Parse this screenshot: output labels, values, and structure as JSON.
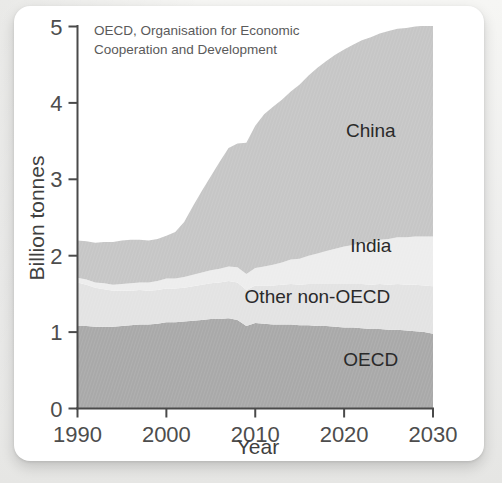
{
  "figure": {
    "note_line1": "OECD,  Organisation for Economic",
    "note_line2": "Cooperation and Development"
  },
  "chart_data": {
    "type": "area",
    "stacked": true,
    "title": "",
    "subtitle": "",
    "note": "OECD,  Organisation for Economic Cooperation and Development",
    "xlabel": "Year",
    "ylabel": "Billion tonnes",
    "xlim": [
      1990,
      2030
    ],
    "ylim": [
      0,
      5
    ],
    "xticks": [
      1990,
      2000,
      2010,
      2020,
      2030
    ],
    "xticklabels": [
      "1990",
      "2000",
      "2010",
      "2020",
      "2030"
    ],
    "yticks": [
      0,
      1,
      2,
      3,
      4,
      5
    ],
    "yticklabels": [
      "0",
      "1",
      "2",
      "3",
      "4",
      "5"
    ],
    "grid": false,
    "legend_position": "inline-annotations",
    "x": [
      1990,
      1991,
      1992,
      1993,
      1994,
      1995,
      1996,
      1997,
      1998,
      1999,
      2000,
      2001,
      2002,
      2003,
      2004,
      2005,
      2006,
      2007,
      2008,
      2009,
      2010,
      2011,
      2012,
      2013,
      2014,
      2015,
      2016,
      2017,
      2018,
      2019,
      2020,
      2021,
      2022,
      2023,
      2024,
      2025,
      2026,
      2027,
      2028,
      2029,
      2030
    ],
    "series": [
      {
        "name": "OECD",
        "color": "#a9a9a9",
        "values": [
          1.08,
          1.08,
          1.07,
          1.07,
          1.07,
          1.08,
          1.09,
          1.1,
          1.1,
          1.11,
          1.13,
          1.13,
          1.14,
          1.15,
          1.16,
          1.17,
          1.17,
          1.18,
          1.16,
          1.08,
          1.12,
          1.11,
          1.1,
          1.1,
          1.1,
          1.09,
          1.09,
          1.08,
          1.08,
          1.07,
          1.06,
          1.06,
          1.05,
          1.04,
          1.04,
          1.03,
          1.03,
          1.02,
          1.01,
          1.0,
          0.98
        ]
      },
      {
        "name": "Other non-OECD",
        "color": "#e3e3e3",
        "values": [
          0.57,
          0.54,
          0.51,
          0.49,
          0.47,
          0.46,
          0.45,
          0.45,
          0.44,
          0.44,
          0.44,
          0.44,
          0.44,
          0.45,
          0.46,
          0.47,
          0.48,
          0.49,
          0.49,
          0.47,
          0.49,
          0.5,
          0.51,
          0.52,
          0.53,
          0.53,
          0.54,
          0.55,
          0.55,
          0.56,
          0.57,
          0.57,
          0.58,
          0.58,
          0.59,
          0.59,
          0.6,
          0.6,
          0.61,
          0.61,
          0.62
        ]
      },
      {
        "name": "India",
        "color": "#ededed",
        "values": [
          0.06,
          0.07,
          0.07,
          0.08,
          0.08,
          0.09,
          0.1,
          0.1,
          0.11,
          0.12,
          0.13,
          0.13,
          0.14,
          0.15,
          0.16,
          0.17,
          0.18,
          0.19,
          0.2,
          0.21,
          0.23,
          0.25,
          0.27,
          0.29,
          0.32,
          0.34,
          0.37,
          0.4,
          0.43,
          0.46,
          0.49,
          0.51,
          0.54,
          0.56,
          0.58,
          0.6,
          0.61,
          0.62,
          0.63,
          0.64,
          0.65
        ]
      },
      {
        "name": "China",
        "color": "#c6c6c6",
        "values": [
          0.49,
          0.5,
          0.52,
          0.54,
          0.56,
          0.57,
          0.57,
          0.56,
          0.55,
          0.55,
          0.56,
          0.61,
          0.72,
          0.9,
          1.07,
          1.23,
          1.4,
          1.55,
          1.62,
          1.72,
          1.86,
          1.99,
          2.07,
          2.13,
          2.2,
          2.28,
          2.36,
          2.43,
          2.49,
          2.54,
          2.58,
          2.62,
          2.65,
          2.68,
          2.7,
          2.72,
          2.73,
          2.74,
          2.75,
          2.76,
          2.77
        ]
      }
    ],
    "annotations": [
      {
        "label": "China",
        "x": 2023,
        "y": 3.55
      },
      {
        "label": "India",
        "x": 2023,
        "y": 2.05
      },
      {
        "label": "Other non-OECD",
        "x": 2017,
        "y": 1.38
      },
      {
        "label": "OECD",
        "x": 2023,
        "y": 0.55
      }
    ]
  },
  "colors": {
    "oecd": "#a9a9a9",
    "other_non_oecd": "#e3e3e3",
    "india": "#ededed",
    "china": "#c6c6c6",
    "axis": "#4a4a4a",
    "text": "#3f3f3f",
    "card": "#ffffff"
  }
}
